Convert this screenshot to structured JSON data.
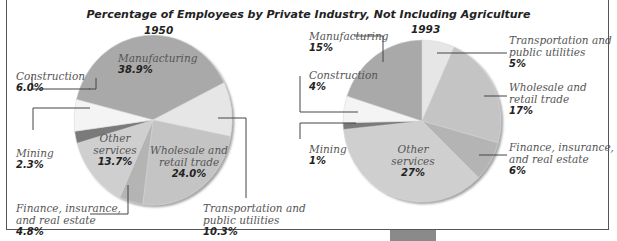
{
  "chart_data": [
    {
      "type": "pie",
      "title": "Percentage of Employees by Private Industry, Not Including Agriculture",
      "subtitle": "1950",
      "categories": [
        "Manufacturing",
        "Transportation and public utilities",
        "Wholesale and retail trade",
        "Finance, insurance, and real estate",
        "Other services",
        "Mining",
        "Construction"
      ],
      "values": [
        38.9,
        10.3,
        24.0,
        4.8,
        13.7,
        2.3,
        6.0
      ],
      "labels": [
        "38.9%",
        "10.3%",
        "24.0%",
        "4.8%",
        "13.7%",
        "2.3%",
        "6.0%"
      ],
      "colors": [
        "#a9a9a9",
        "#e6e6e6",
        "#c4c4c4",
        "#b4b4b4",
        "#cfcfcf",
        "#7a7a7a",
        "#f4f4f4"
      ]
    },
    {
      "type": "pie",
      "title": "Percentage of Employees by Private Industry, Not Including Agriculture",
      "subtitle": "1993",
      "categories": [
        "Transportation and public utilities",
        "Wholesale and retail trade",
        "Finance, insurance, and real estate",
        "Other services",
        "Mining",
        "Construction",
        "Manufacturing"
      ],
      "values": [
        5,
        17,
        6,
        27,
        1,
        4,
        15
      ],
      "labels": [
        "5%",
        "17%",
        "6%",
        "27%",
        "1%",
        "4%",
        "15%"
      ],
      "colors": [
        "#e6e6e6",
        "#c4c4c4",
        "#b4b4b4",
        "#cfcfcf",
        "#7a7a7a",
        "#f4f4f4",
        "#a9a9a9"
      ]
    }
  ],
  "title": "Percentage of Employees by Private Industry, Not Including Agriculture",
  "pie1950": {
    "year": "1950",
    "manufacturing": {
      "name": "Manufacturing",
      "pct": "38.9%"
    },
    "construction": {
      "name": "Construction",
      "pct": "6.0%"
    },
    "mining": {
      "name": "Mining",
      "pct": "2.3%"
    },
    "other": {
      "name1": "Other",
      "name2": "services",
      "pct": "13.7%"
    },
    "wholesale": {
      "name1": "Wholesale and",
      "name2": "retail trade",
      "pct": "24.0%"
    },
    "finance": {
      "name1": "Finance, insurance,",
      "name2": "and real estate",
      "pct": "4.8%"
    },
    "transport": {
      "name1": "Transportation and",
      "name2": "public utilities",
      "pct": "10.3%"
    }
  },
  "pie1993": {
    "year": "1993",
    "manufacturing": {
      "name": "Manufacturing",
      "pct": "15%"
    },
    "construction": {
      "name": "Construction",
      "pct": "4%"
    },
    "mining": {
      "name": "Mining",
      "pct": "1%"
    },
    "other": {
      "name1": "Other",
      "name2": "services",
      "pct": "27%"
    },
    "wholesale": {
      "name1": "Wholesale and",
      "name2": "retail trade",
      "pct": "17%"
    },
    "finance": {
      "name1": "Finance, insurance,",
      "name2": "and real estate",
      "pct": "6%"
    },
    "transport": {
      "name1": "Transportation and",
      "name2": "public utilities",
      "pct": "5%"
    }
  }
}
